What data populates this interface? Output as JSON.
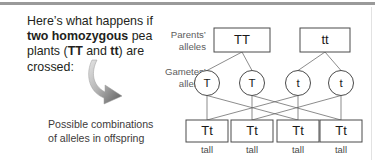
{
  "figure": {
    "intro_html": "Here&rsquo;s what happens if <b>two homozygous</b> pea plants (<b>TT</b> and <b>tt</b>) are crossed:",
    "intro_plain": "Here's what happens if two homozygous pea plants (TT and tt) are crossed:",
    "labels": {
      "parents": "Parents&rsquo;\nalleles",
      "parents_line1": "Parents’",
      "parents_line2": "alleles",
      "gametes_line1": "Gametes’",
      "gametes_line2": "alleles",
      "offspring_line1": "Possible combinations",
      "offspring_line2": "of alleles in offspring"
    },
    "colors": {
      "text": "#231f20",
      "label_gray": "#5d5d5d",
      "stroke": "#4a4a4a",
      "line": "#5a5a5a",
      "arrow_dark": "#5b5b5b",
      "arrow_light": "#d2d2d2",
      "top_rule": "#9a9a9a"
    },
    "arrow_icon": "curved-down-right-arrow"
  },
  "chart_data": {
    "type": "diagram",
    "rows": [
      {
        "name": "parents",
        "shape": "box",
        "label": "Parents' alleles",
        "nodes": [
          {
            "id": "p1",
            "genotype": "TT",
            "cx": 242,
            "cy": 40,
            "w": 56,
            "h": 24
          },
          {
            "id": "p2",
            "genotype": "tt",
            "cx": 325,
            "cy": 40,
            "w": 50,
            "h": 24
          }
        ]
      },
      {
        "name": "gametes",
        "shape": "circle",
        "label": "Gametes' alleles",
        "nodes": [
          {
            "id": "g1",
            "genotype": "T",
            "cx": 207,
            "cy": 83,
            "r": 12.5
          },
          {
            "id": "g2",
            "genotype": "T",
            "cx": 252,
            "cy": 83,
            "r": 12.5
          },
          {
            "id": "g3",
            "genotype": "t",
            "cx": 298,
            "cy": 83,
            "r": 12.5
          },
          {
            "id": "g4",
            "genotype": "t",
            "cx": 341,
            "cy": 83,
            "r": 12.5
          }
        ]
      },
      {
        "name": "offspring",
        "shape": "box",
        "label": "Possible combinations of alleles in offspring",
        "nodes": [
          {
            "id": "o1",
            "genotype": "Tt",
            "phenotype": "tall",
            "cx": 207,
            "cy": 131,
            "w": 42,
            "h": 22
          },
          {
            "id": "o2",
            "genotype": "Tt",
            "phenotype": "tall",
            "cx": 252,
            "cy": 131,
            "w": 42,
            "h": 22
          },
          {
            "id": "o3",
            "genotype": "Tt",
            "phenotype": "tall",
            "cx": 298,
            "cy": 131,
            "w": 42,
            "h": 22
          },
          {
            "id": "o4",
            "genotype": "Tt",
            "phenotype": "tall",
            "cx": 341,
            "cy": 131,
            "w": 42,
            "h": 22
          }
        ]
      }
    ],
    "edges": [
      {
        "from": "p1",
        "to": "g1"
      },
      {
        "from": "p1",
        "to": "g2"
      },
      {
        "from": "p2",
        "to": "g3"
      },
      {
        "from": "p2",
        "to": "g4"
      },
      {
        "from": "g1",
        "to": "o1"
      },
      {
        "from": "g1",
        "to": "o3"
      },
      {
        "from": "g2",
        "to": "o2"
      },
      {
        "from": "g2",
        "to": "o4"
      },
      {
        "from": "g3",
        "to": "o1"
      },
      {
        "from": "g3",
        "to": "o3"
      },
      {
        "from": "g4",
        "to": "o2"
      },
      {
        "from": "g4",
        "to": "o4"
      }
    ],
    "genotype_ratio": "4 Tt",
    "phenotype_ratio": "4 tall"
  }
}
